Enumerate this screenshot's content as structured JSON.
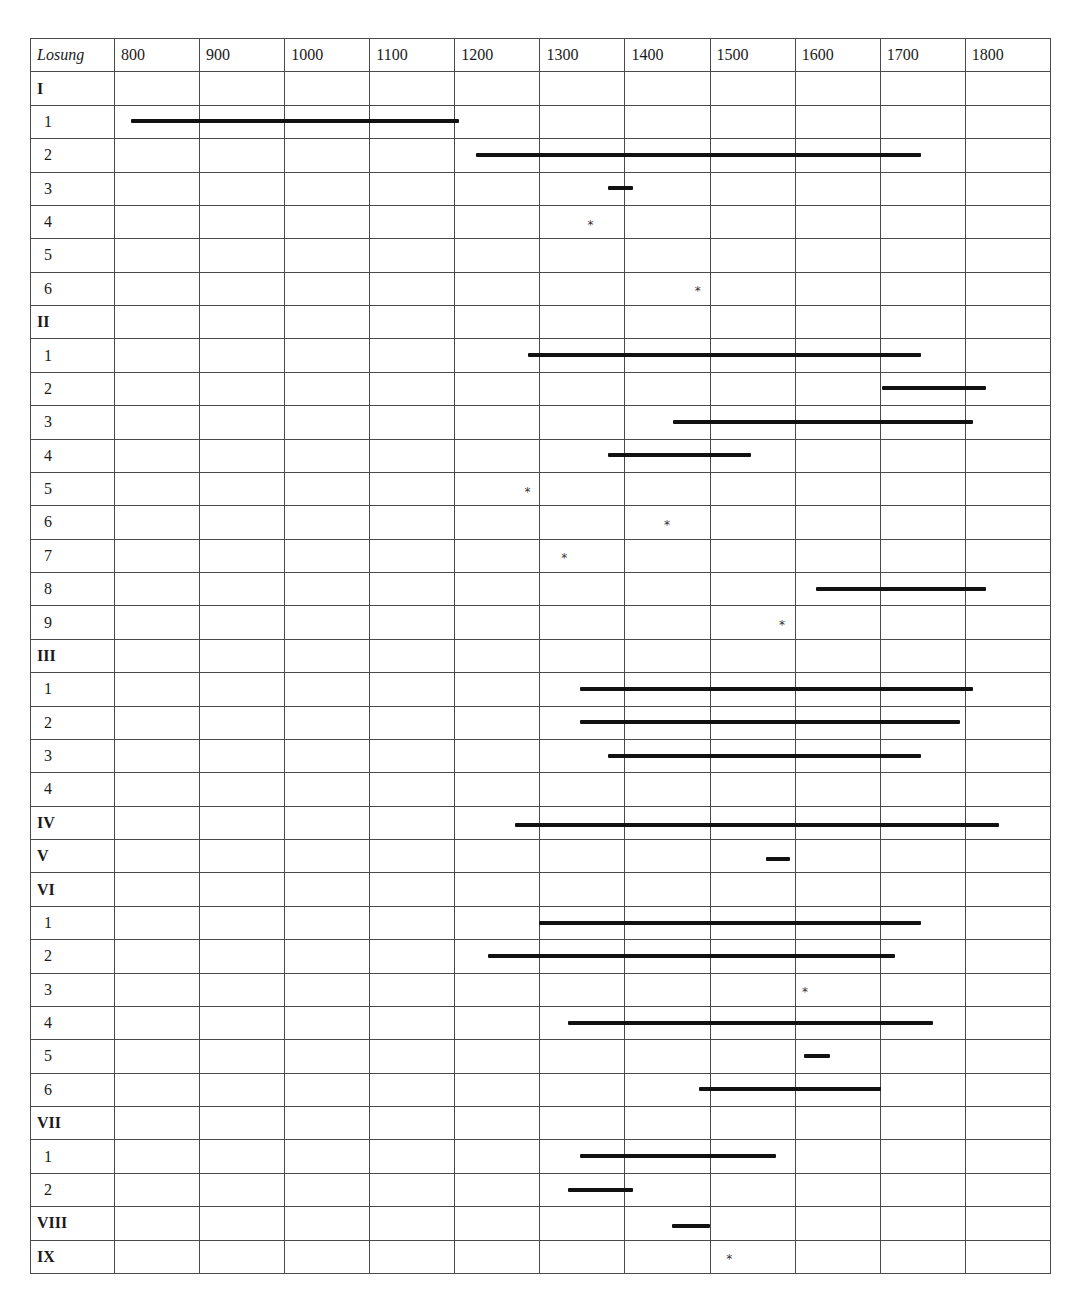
{
  "chart_data": {
    "type": "table",
    "subtype": "timeline-range-chart",
    "title": "",
    "header_label": "Losung",
    "x_axis": {
      "label": "Year",
      "ticks": [
        "800",
        "900",
        "1000",
        "1100",
        "1200",
        "1300",
        "1400",
        "1500",
        "1600",
        "1700",
        "1800"
      ],
      "range": [
        800,
        1900
      ]
    },
    "grid": true,
    "legend": {
      "bar": "attested period (range)",
      "star": "single attestation (point)"
    },
    "rows": [
      {
        "label": "I",
        "group": true
      },
      {
        "label": "1",
        "group": false,
        "type": "range",
        "start": 820,
        "end": 1205
      },
      {
        "label": "2",
        "group": false,
        "type": "range",
        "start": 1225,
        "end": 1748
      },
      {
        "label": "3",
        "group": false,
        "type": "range",
        "start": 1380,
        "end": 1410
      },
      {
        "label": "4",
        "group": false,
        "type": "point",
        "at": 1360
      },
      {
        "label": "5",
        "group": false
      },
      {
        "label": "6",
        "group": false,
        "type": "point",
        "at": 1486
      },
      {
        "label": "II",
        "group": true
      },
      {
        "label": "1",
        "group": false,
        "type": "range",
        "start": 1286,
        "end": 1748
      },
      {
        "label": "2",
        "group": false,
        "type": "range",
        "start": 1703,
        "end": 1825
      },
      {
        "label": "3",
        "group": false,
        "type": "range",
        "start": 1457,
        "end": 1809
      },
      {
        "label": "4",
        "group": false,
        "type": "range",
        "start": 1380,
        "end": 1549
      },
      {
        "label": "5",
        "group": false,
        "type": "point",
        "at": 1286
      },
      {
        "label": "6",
        "group": false,
        "type": "point",
        "at": 1450
      },
      {
        "label": "7",
        "group": false,
        "type": "point",
        "at": 1329
      },
      {
        "label": "8",
        "group": false,
        "type": "range",
        "start": 1625,
        "end": 1825
      },
      {
        "label": "9",
        "group": false,
        "type": "point",
        "at": 1585
      },
      {
        "label": "III",
        "group": true
      },
      {
        "label": "1",
        "group": false,
        "type": "range",
        "start": 1348,
        "end": 1809
      },
      {
        "label": "2",
        "group": false,
        "type": "range",
        "start": 1348,
        "end": 1794
      },
      {
        "label": "3",
        "group": false,
        "type": "range",
        "start": 1380,
        "end": 1748
      },
      {
        "label": "4",
        "group": false
      },
      {
        "label": "IV",
        "group": true,
        "type": "range",
        "start": 1271,
        "end": 1840
      },
      {
        "label": "V",
        "group": true,
        "type": "range",
        "start": 1566,
        "end": 1595
      },
      {
        "label": "VI",
        "group": true
      },
      {
        "label": "1",
        "group": false,
        "type": "range",
        "start": 1300,
        "end": 1748
      },
      {
        "label": "2",
        "group": false,
        "type": "range",
        "start": 1240,
        "end": 1718
      },
      {
        "label": "3",
        "group": false,
        "type": "point",
        "at": 1612
      },
      {
        "label": "4",
        "group": false,
        "type": "range",
        "start": 1334,
        "end": 1762
      },
      {
        "label": "5",
        "group": false,
        "type": "range",
        "start": 1611,
        "end": 1641
      },
      {
        "label": "6",
        "group": false,
        "type": "range",
        "start": 1488,
        "end": 1702
      },
      {
        "label": "VII",
        "group": true
      },
      {
        "label": "1",
        "group": false,
        "type": "range",
        "start": 1348,
        "end": 1578
      },
      {
        "label": "2",
        "group": false,
        "type": "range",
        "start": 1333,
        "end": 1410
      },
      {
        "label": "VIII",
        "group": true,
        "type": "range",
        "start": 1456,
        "end": 1501
      },
      {
        "label": "IX",
        "group": true,
        "type": "point",
        "at": 1523
      }
    ]
  },
  "style": {
    "bar_color": "#111111",
    "grid_color": "#4a4a4a",
    "star_glyph": "*"
  }
}
